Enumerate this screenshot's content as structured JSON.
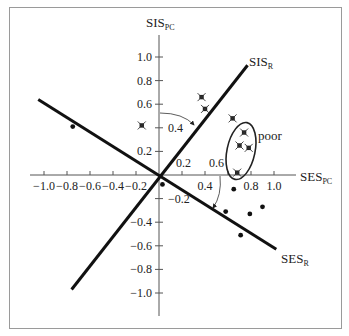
{
  "chart_data": {
    "type": "scatter",
    "title": "",
    "xlabel": "SES_PC",
    "ylabel": "SIS_PC",
    "axes": {
      "x": {
        "label_main": "SES",
        "label_sub": "PC",
        "range": [
          -1.0,
          1.0
        ],
        "ticks": [
          -1.0,
          -0.8,
          -0.6,
          -0.4,
          -0.2,
          0.2,
          0.4,
          0.6,
          0.8,
          1.0
        ],
        "tick_labels_below": [
          "−1.0",
          "−0.8",
          "−0.6",
          "−0.4",
          "−0.2",
          "0.4",
          "0.8",
          "1.0"
        ]
      },
      "y": {
        "label_main": "SIS",
        "label_sub": "PC",
        "range": [
          -1.0,
          1.0
        ],
        "ticks": [
          1.0,
          0.8,
          0.6,
          0.4,
          0.2,
          -0.2,
          -0.4,
          -0.6,
          -0.8,
          -1.0
        ],
        "tick_labels": [
          "1.0",
          "0.8",
          "0.6",
          "0.2",
          "−0.4",
          "−0.6",
          "−0.8",
          "−1.0"
        ]
      },
      "grid": false
    },
    "rotated_axes": [
      {
        "name": "SIS_R",
        "label_main": "SIS",
        "label_sub": "R",
        "from": [
          -0.76,
          -0.97
        ],
        "to": [
          0.77,
          0.93
        ]
      },
      {
        "name": "SES_R",
        "label_main": "SES",
        "label_sub": "R",
        "from": [
          -1.05,
          0.64
        ],
        "to": [
          1.02,
          -0.63
        ]
      }
    ],
    "rotation_annotations": [
      {
        "label": "0.4",
        "between": [
          "SIS_PC",
          "SIS_R"
        ]
      },
      {
        "label": "0.2",
        "along": "SIS_R"
      },
      {
        "label": "0.6",
        "along": "SES_R_arc"
      },
      {
        "label": "−0.2",
        "along": "SES_R"
      }
    ],
    "series": [
      {
        "name": "starred",
        "marker": "x-box",
        "points": [
          [
            -0.15,
            0.42
          ],
          [
            0.37,
            0.66
          ],
          [
            0.4,
            0.56
          ],
          [
            0.64,
            0.48
          ],
          [
            0.74,
            0.36
          ],
          [
            0.7,
            0.25
          ],
          [
            0.78,
            0.23
          ],
          [
            0.68,
            0.02
          ]
        ]
      },
      {
        "name": "dots",
        "marker": "dot",
        "points": [
          [
            -0.75,
            0.41
          ],
          [
            0.03,
            -0.08
          ],
          [
            0.65,
            -0.12
          ],
          [
            0.58,
            -0.31
          ],
          [
            0.79,
            -0.33
          ],
          [
            0.9,
            -0.27
          ],
          [
            0.71,
            -0.51
          ]
        ]
      }
    ],
    "group_annotation": {
      "label": "poor",
      "shape": "ellipse",
      "center": [
        0.71,
        0.19
      ],
      "rx": 0.12,
      "ry": 0.25
    }
  },
  "labels": {
    "x_axis_main": "SES",
    "x_axis_sub": "PC",
    "y_axis_main": "SIS",
    "y_axis_sub": "PC",
    "sis_r_main": "SIS",
    "sis_r_sub": "R",
    "ses_r_main": "SES",
    "ses_r_sub": "R",
    "poor": "poor",
    "arc_label_04": "0.4",
    "rot_label_02": "0.2",
    "rot_label_06": "0.6",
    "rot_label_neg02": "−0.2"
  }
}
